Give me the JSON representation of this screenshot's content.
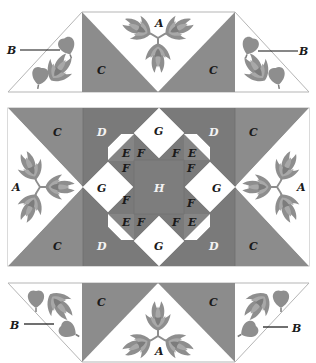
{
  "diagram": {
    "colors": {
      "background": "#ffffff",
      "outline": "#b5b5b5",
      "piece_c": "#8c8c8c",
      "piece_d": "#7a7a7a",
      "piece_f": "#858585",
      "piece_h": "#7d7d7d",
      "white": "#ffffff",
      "flower_outer": "#8e8e8e",
      "flower_inner": "#a8a8a8",
      "flower_core": "#7c7c7c",
      "leader_line": "#111111"
    },
    "top_band": {
      "labels": {
        "a": "A",
        "c_left": "C",
        "c_right": "C",
        "b_left": "B",
        "b_right": "B"
      }
    },
    "center_block": {
      "labels": {
        "c_tl": "C",
        "c_bl": "C",
        "c_tr": "C",
        "c_br": "C",
        "d_tl": "D",
        "d_bl": "D",
        "d_tr": "D",
        "d_br": "D",
        "a_left": "A",
        "a_right": "A",
        "g_top": "G",
        "g_bottom": "G",
        "g_left": "G",
        "g_right": "G",
        "h": "H",
        "e_tl": "E",
        "e_tr": "E",
        "e_bl": "E",
        "e_br": "E",
        "f_tl1": "F",
        "f_tl2": "F",
        "f_tr1": "F",
        "f_tr2": "F",
        "f_bl1": "F",
        "f_bl2": "F",
        "f_br1": "F",
        "f_br2": "F"
      }
    },
    "bottom_band": {
      "labels": {
        "a": "A",
        "c_left": "C",
        "c_right": "C",
        "b_left": "B",
        "b_right": "B"
      }
    }
  }
}
